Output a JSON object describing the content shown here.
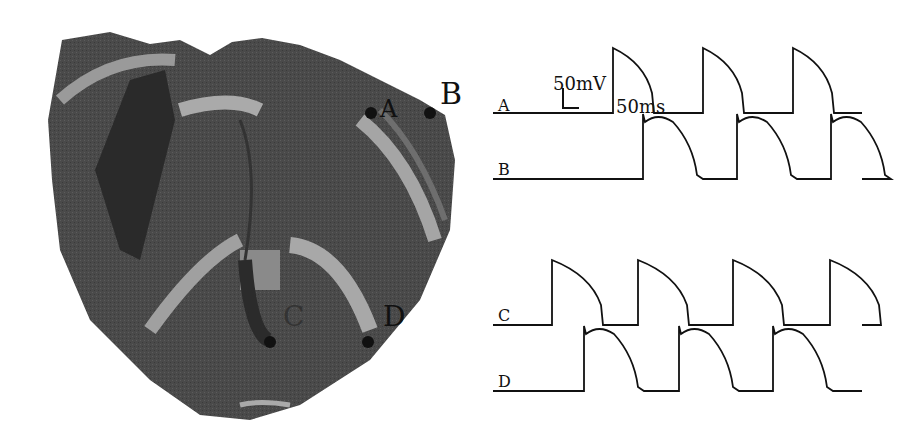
{
  "figure": {
    "heart_labels": {
      "A": "A",
      "B": "B",
      "C": "C",
      "D": "D"
    },
    "scale_bar": {
      "voltage": "50mV",
      "time": "50ms"
    },
    "traces": [
      {
        "label": "A",
        "baseline_y": 113,
        "upstrokes": [
          613,
          703,
          793
        ],
        "width": 45
      },
      {
        "label": "B",
        "baseline_y": 179,
        "upstrokes": [
          643,
          737,
          831
        ],
        "width": 60
      },
      {
        "label": "C",
        "baseline_y": 325,
        "upstrokes": [
          552,
          638,
          733,
          830
        ],
        "width": 55
      },
      {
        "label": "D",
        "baseline_y": 391,
        "upstrokes": [
          584,
          679,
          773
        ],
        "width": 60
      }
    ]
  }
}
